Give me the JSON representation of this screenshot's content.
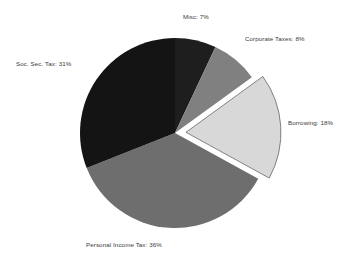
{
  "background_color": "#ffffff",
  "label_color": "#3a3a3a",
  "geometry": {
    "center_x": 175,
    "center_y": 133,
    "radius": 95,
    "explode_offset": 11,
    "start_angle_deg": 0,
    "direction": "clockwise"
  },
  "chart_data": {
    "type": "pie",
    "title": "",
    "subtitle": "",
    "xlabel": "",
    "ylabel": "",
    "legend_position": "none",
    "grid": false,
    "units": "percent",
    "total": 100,
    "categories": [
      "Misc",
      "Corporate Taxes",
      "Borrowing",
      "Personal Income Tax",
      "Soc. Sec. Tax"
    ],
    "values": [
      7,
      8,
      18,
      36,
      31
    ],
    "colors": [
      "#1e1e1e",
      "#808080",
      "#d8d8d8",
      "#6e6e6e",
      "#141414"
    ],
    "exploded": [
      false,
      false,
      true,
      false,
      false
    ],
    "slices": [
      {
        "name": "Misc",
        "label": "Misc: 7%",
        "value": 7,
        "color": "#1e1e1e",
        "exploded": false,
        "start_deg": 0,
        "end_deg": 25.2
      },
      {
        "name": "Corporate Taxes",
        "label": "Corporate Taxes: 8%",
        "value": 8,
        "color": "#808080",
        "exploded": false,
        "start_deg": 25.2,
        "end_deg": 54.0
      },
      {
        "name": "Borrowing",
        "label": "Borrowing: 18%",
        "value": 18,
        "color": "#d8d8d8",
        "exploded": true,
        "start_deg": 54.0,
        "end_deg": 118.8
      },
      {
        "name": "Personal Income Tax",
        "label": "Personal Income Tax: 36%",
        "value": 36,
        "color": "#6e6e6e",
        "exploded": false,
        "start_deg": 118.8,
        "end_deg": 248.4
      },
      {
        "name": "Soc. Sec. Tax",
        "label": "Soc. Sec. Tax: 31%",
        "value": 31,
        "color": "#141414",
        "exploded": false,
        "start_deg": 248.4,
        "end_deg": 360.0
      }
    ]
  },
  "labels": {
    "misc": "Misc: 7%",
    "corporate_taxes": "Corporate Taxes: 8%",
    "borrowing": "Borrowing: 18%",
    "personal_income_tax": "Personal Income Tax: 36%",
    "soc_sec_tax": "Soc. Sec. Tax: 31%"
  }
}
